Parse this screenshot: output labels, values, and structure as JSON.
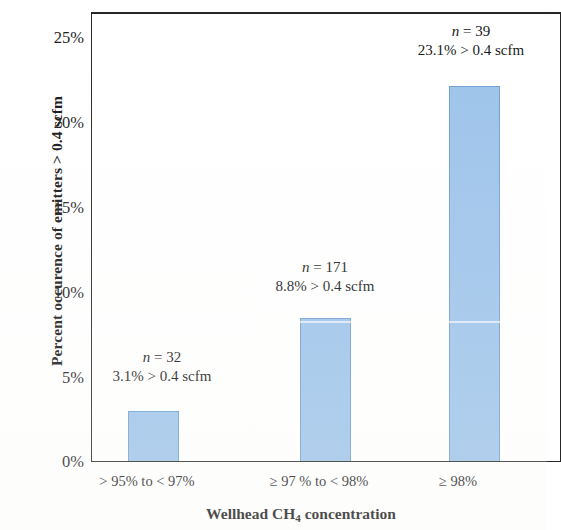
{
  "chart_data": {
    "type": "bar",
    "title": "",
    "xlabel": "Wellhead CH4 concentration",
    "ylabel": "Percent occurence of emitters > 0.4 scfm",
    "categories": [
      "> 95% to < 97%",
      "≥ 97 % to < 98%",
      "≥ 98%"
    ],
    "values": [
      3.1,
      8.8,
      23.1
    ],
    "ylim": [
      0,
      27.5
    ],
    "ytick_labels": [
      "0%",
      "5%",
      "10%",
      "15%",
      "20%",
      "25%"
    ],
    "ytick_values": [
      0,
      5,
      10,
      15,
      20,
      25
    ],
    "grid": false,
    "legend": null,
    "bar_color": "#9cc3ea",
    "bar_border_color": "#6f9fd0",
    "sample_sizes": [
      32,
      171,
      39
    ],
    "annotations": [
      {
        "n_label": "n",
        "n_equals": " = 32",
        "pct": "3.1% > 0.4 scfm"
      },
      {
        "n_label": "n",
        "n_equals": " = 171",
        "pct": "8.8% > 0.4 scfm"
      },
      {
        "n_label": "n",
        "n_equals": " = 39",
        "pct": "23.1% > 0.4 scfm"
      }
    ]
  },
  "axes": {
    "y_title": "Percent occurence of emitters > 0.4 scfm",
    "x_title_main": "Wellhead CH",
    "x_title_sub": "4",
    "x_title_tail": " concentration",
    "y_ticks": [
      {
        "label": "25%"
      },
      {
        "label": "20%"
      },
      {
        "label": "15%"
      },
      {
        "label": "10%"
      },
      {
        "label": "5%"
      },
      {
        "label": "0%"
      }
    ],
    "x_ticks": [
      {
        "label": "> 95% to < 97%"
      },
      {
        "label": "≥ 97 % to < 98%"
      },
      {
        "label": "≥ 98%"
      }
    ]
  }
}
